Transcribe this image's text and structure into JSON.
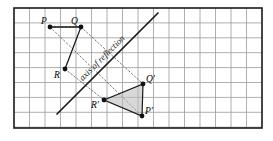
{
  "figure": {
    "frame": {
      "x": 14,
      "y": 8,
      "width": 248,
      "height": 120,
      "border_color": "#1a1a1a"
    },
    "grid": {
      "cell_width": 15.5,
      "cell_height": 14.9,
      "line_color": "#9a9a9a",
      "visible": true
    },
    "axis_of_reflection": {
      "label": "axis of reflection",
      "x1": 57,
      "y1": 114,
      "x2": 158,
      "y2": 13,
      "color": "#1a1a1a",
      "rotation_deg": -45,
      "label_x": 104,
      "label_y": 60
    },
    "preimage": {
      "name": "triangle PQR",
      "fill": "none",
      "stroke": "#1a1a1a",
      "vertices": [
        {
          "id": "P",
          "label": "P",
          "x": 50,
          "y": 27,
          "label_dx": -9,
          "label_dy": -3
        },
        {
          "id": "Q",
          "label": "Q",
          "x": 81,
          "y": 27,
          "label_dx": -10,
          "label_dy": -3
        },
        {
          "id": "R",
          "label": "R",
          "x": 65,
          "y": 69,
          "label_dx": -11,
          "label_dy": 9
        }
      ]
    },
    "image": {
      "name": "triangle R'Q'P'",
      "fill": "#b8b8b8",
      "fill_opacity": 0.55,
      "stroke": "#1a1a1a",
      "vertices": [
        {
          "id": "Rp",
          "label": "R'",
          "x": 104,
          "y": 100,
          "label_dx": -13,
          "label_dy": 8
        },
        {
          "id": "Qp",
          "label": "Q'",
          "x": 143,
          "y": 84,
          "label_dx": 3,
          "label_dy": -2
        },
        {
          "id": "Pp",
          "label": "P'",
          "x": 142,
          "y": 116,
          "label_dx": 3,
          "label_dy": -2
        }
      ]
    },
    "construction_lines": {
      "style": "dotted",
      "color": "#6a6a6a",
      "pairs": [
        {
          "from": "P",
          "to": "Pp",
          "x1": 50,
          "y1": 27,
          "x2": 142,
          "y2": 116
        },
        {
          "from": "Q",
          "to": "Qp",
          "x1": 81,
          "y1": 27,
          "x2": 143,
          "y2": 84
        },
        {
          "from": "R",
          "to": "Rp",
          "x1": 65,
          "y1": 69,
          "x2": 104,
          "y2": 100
        }
      ],
      "connectors": [
        {
          "from": "P",
          "to": "Q",
          "x1": 50,
          "y1": 27,
          "x2": 81,
          "y2": 27
        }
      ]
    },
    "point_marker": {
      "radius": 2.4,
      "color": "#111111"
    }
  }
}
